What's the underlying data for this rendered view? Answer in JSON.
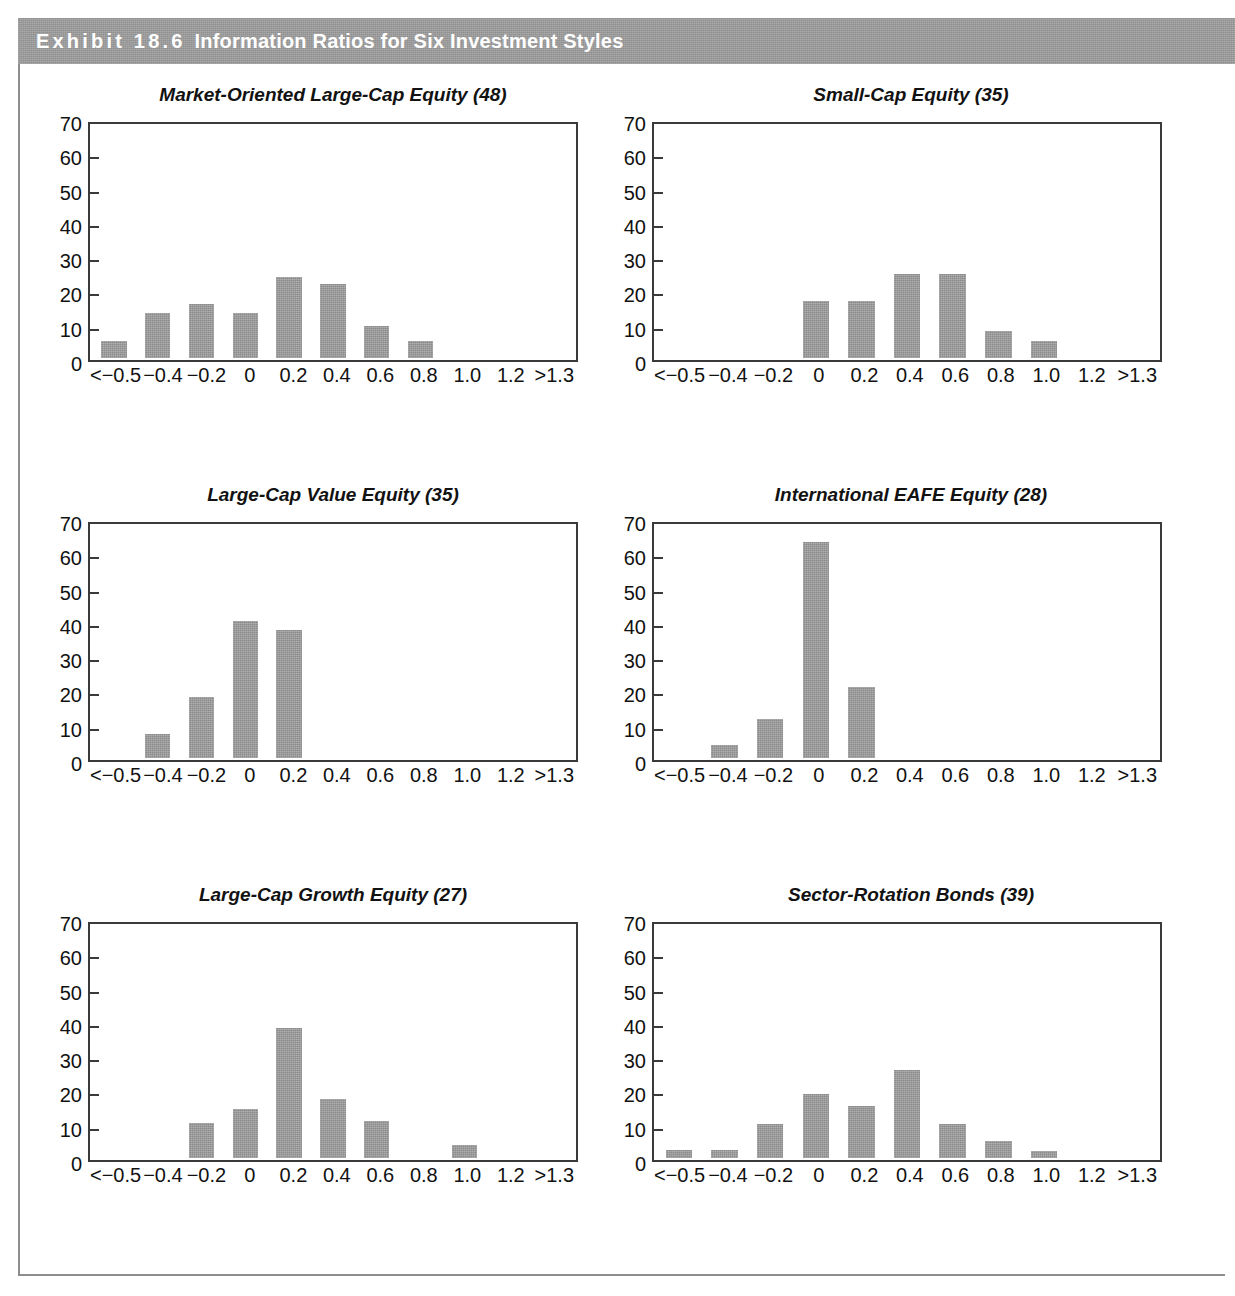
{
  "exhibit": {
    "label": "Exhibit 18.6",
    "title": "Information Ratios for Six Investment Styles"
  },
  "axis": {
    "x_ticks": [
      "<−0.5",
      "−0.4",
      "−0.2",
      "0",
      "0.2",
      "0.4",
      "0.6",
      "0.8",
      "1.0",
      "1.2",
      ">1.3"
    ],
    "y_ticks": [
      "70",
      "60",
      "50",
      "40",
      "30",
      "20",
      "10",
      "0"
    ],
    "ylim": [
      0,
      70
    ]
  },
  "colors": {
    "bar": "#9c9c9c",
    "frame": "#3a3a3a",
    "header_band": "#9d9d9d",
    "header_text": "#ffffff",
    "rule": "#8d8d8d"
  },
  "chart_data": [
    {
      "type": "bar",
      "title": "Market-Oriented Large-Cap Equity (48)",
      "xlabel": "",
      "ylabel": "",
      "ylim": [
        0,
        70
      ],
      "grid": false,
      "legend": "none",
      "categories": [
        "<−0.5",
        "−0.4",
        "−0.2",
        "0",
        "0.2",
        "0.4",
        "0.6",
        "0.8",
        "1.0",
        "1.2",
        ">1.3"
      ],
      "values": [
        5,
        13.5,
        16,
        13.5,
        24,
        22,
        9.5,
        5,
        0,
        0,
        0
      ]
    },
    {
      "type": "bar",
      "title": "Small-Cap Equity (35)",
      "xlabel": "",
      "ylabel": "",
      "ylim": [
        0,
        70
      ],
      "grid": false,
      "legend": "none",
      "categories": [
        "<−0.5",
        "−0.4",
        "−0.2",
        "0",
        "0.2",
        "0.4",
        "0.6",
        "0.8",
        "1.0",
        "1.2",
        ">1.3"
      ],
      "values": [
        0,
        0,
        0,
        17,
        17,
        25,
        25,
        8,
        5,
        0,
        0
      ]
    },
    {
      "type": "bar",
      "title": "Large-Cap Value Equity (35)",
      "xlabel": "",
      "ylabel": "",
      "ylim": [
        0,
        70
      ],
      "grid": false,
      "legend": "none",
      "categories": [
        "<−0.5",
        "−0.4",
        "−0.2",
        "0",
        "0.2",
        "0.4",
        "0.6",
        "0.8",
        "1.0",
        "1.2",
        ">1.3"
      ],
      "values": [
        0,
        7,
        18,
        40.5,
        38,
        0,
        0,
        0,
        0,
        0,
        0
      ]
    },
    {
      "type": "bar",
      "title": "International EAFE Equity (28)",
      "xlabel": "",
      "ylabel": "",
      "ylim": [
        0,
        70
      ],
      "grid": false,
      "legend": "none",
      "categories": [
        "<−0.5",
        "−0.4",
        "−0.2",
        "0",
        "0.2",
        "0.4",
        "0.6",
        "0.8",
        "1.0",
        "1.2",
        ">1.3"
      ],
      "values": [
        0,
        4,
        11.5,
        64,
        21,
        0,
        0,
        0,
        0,
        0,
        0
      ]
    },
    {
      "type": "bar",
      "title": "Large-Cap Growth Equity (27)",
      "xlabel": "",
      "ylabel": "",
      "ylim": [
        0,
        70
      ],
      "grid": false,
      "legend": "none",
      "categories": [
        "<−0.5",
        "−0.4",
        "−0.2",
        "0",
        "0.2",
        "0.4",
        "0.6",
        "0.8",
        "1.0",
        "1.2",
        ">1.3"
      ],
      "values": [
        0,
        0,
        10.5,
        14.5,
        38.5,
        17.5,
        11,
        0,
        4,
        0,
        0
      ]
    },
    {
      "type": "bar",
      "title": "Sector-Rotation Bonds (39)",
      "xlabel": "",
      "ylabel": "",
      "ylim": [
        0,
        70
      ],
      "grid": false,
      "legend": "none",
      "categories": [
        "<−0.5",
        "−0.4",
        "−0.2",
        "0",
        "0.2",
        "0.4",
        "0.6",
        "0.8",
        "1.0",
        "1.2",
        ">1.3"
      ],
      "values": [
        2.5,
        2.5,
        10,
        19,
        15.5,
        26,
        10,
        5,
        2,
        0,
        0
      ]
    }
  ]
}
